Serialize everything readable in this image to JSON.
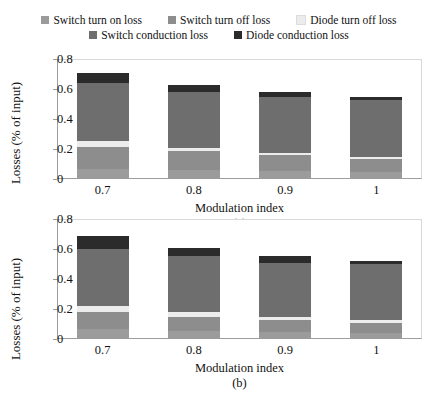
{
  "legend": {
    "rows": [
      [
        {
          "label": "Switch turn on loss",
          "color": "#9b9b9b",
          "key": "switch_turn_on"
        },
        {
          "label": "Switch turn off loss",
          "color": "#8d8d8d",
          "key": "switch_turn_off"
        },
        {
          "label": "Diode turn off loss",
          "color": "#ececec",
          "key": "diode_turn_off"
        }
      ],
      [
        {
          "label": "Switch conduction loss",
          "color": "#6e6e6e",
          "key": "switch_conduction"
        },
        {
          "label": "Diode conduction loss",
          "color": "#2b2b2b",
          "key": "diode_conduction"
        }
      ]
    ]
  },
  "chart_data": [
    {
      "type": "bar",
      "stacked": true,
      "panel": "(a)",
      "title": "",
      "xlabel": "Modulation index",
      "ylabel": "Losses (% of input)",
      "categories": [
        "0.7",
        "0.8",
        "0.9",
        "1"
      ],
      "ylim": [
        0,
        0.8
      ],
      "yticks": [
        "0",
        "0.2",
        "0.4",
        "0.6",
        "0.8"
      ],
      "ytick_values": [
        0,
        0.2,
        0.4,
        0.6,
        0.8
      ],
      "grid": false,
      "legend_position": "top",
      "series": [
        {
          "name": "Switch turn on loss",
          "color": "#9b9b9b",
          "values": [
            0.07,
            0.06,
            0.055,
            0.05
          ]
        },
        {
          "name": "Switch turn off loss",
          "color": "#8d8d8d",
          "values": [
            0.145,
            0.13,
            0.105,
            0.085
          ]
        },
        {
          "name": "Diode turn off loss",
          "color": "#ececec",
          "values": [
            0.04,
            0.02,
            0.015,
            0.015
          ]
        },
        {
          "name": "Switch conduction loss",
          "color": "#6e6e6e",
          "values": [
            0.385,
            0.37,
            0.37,
            0.38
          ]
        },
        {
          "name": "Diode conduction loss",
          "color": "#2b2b2b",
          "values": [
            0.07,
            0.05,
            0.035,
            0.02
          ]
        }
      ],
      "totals": [
        0.71,
        0.63,
        0.58,
        0.55
      ]
    },
    {
      "type": "bar",
      "stacked": true,
      "panel": "(b)",
      "title": "",
      "xlabel": "Modulation index",
      "ylabel": "Losses (% of input)",
      "categories": [
        "0.7",
        "0.8",
        "0.9",
        "1"
      ],
      "ylim": [
        0,
        0.8
      ],
      "yticks": [
        "0",
        "0.2",
        "0.4",
        "0.6",
        "0.8"
      ],
      "ytick_values": [
        0,
        0.2,
        0.4,
        0.6,
        0.8
      ],
      "grid": false,
      "legend_position": "top",
      "series": [
        {
          "name": "Switch turn on loss",
          "color": "#9b9b9b",
          "values": [
            0.065,
            0.055,
            0.045,
            0.04
          ]
        },
        {
          "name": "Switch turn off loss",
          "color": "#8d8d8d",
          "values": [
            0.115,
            0.095,
            0.085,
            0.07
          ]
        },
        {
          "name": "Diode turn off loss",
          "color": "#ececec",
          "values": [
            0.04,
            0.03,
            0.02,
            0.015
          ]
        },
        {
          "name": "Switch conduction loss",
          "color": "#6e6e6e",
          "values": [
            0.38,
            0.375,
            0.36,
            0.375
          ]
        },
        {
          "name": "Diode conduction loss",
          "color": "#2b2b2b",
          "values": [
            0.09,
            0.055,
            0.045,
            0.02
          ]
        }
      ],
      "totals": [
        0.69,
        0.61,
        0.555,
        0.52
      ]
    }
  ]
}
